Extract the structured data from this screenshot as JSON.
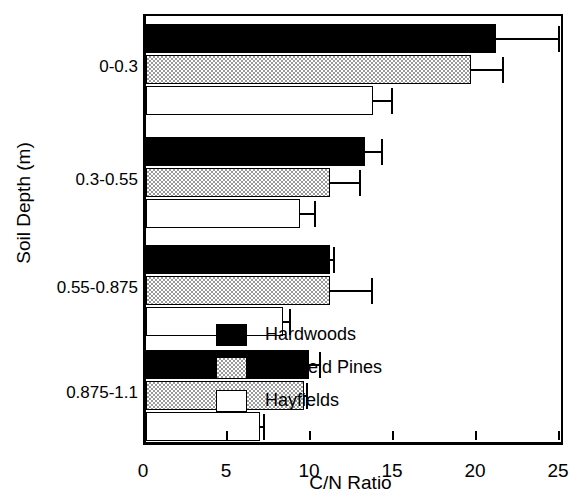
{
  "chart_data": {
    "type": "bar",
    "orientation": "horizontal",
    "title": "",
    "xlabel": "C/N Ratio",
    "ylabel": "Soil Depth (m)",
    "xlim": [
      0,
      25
    ],
    "xticks": [
      0,
      5,
      10,
      15,
      20,
      25
    ],
    "xticklabels": [
      "0",
      "5",
      "10",
      "15",
      "20",
      "25"
    ],
    "grid": false,
    "legend_position": "inside-lower-right",
    "categories": [
      "0-0.3",
      "0.3-0.55",
      "0.55-0.875",
      "0.875-1.1"
    ],
    "series": [
      {
        "name": "Hardwoods",
        "color": "#000000",
        "fill": "solid-black",
        "values": [
          21.1,
          13.2,
          11.1,
          9.8
        ],
        "errors": [
          3.8,
          1.0,
          0.2,
          0.7
        ]
      },
      {
        "name": "Old-field Pines",
        "color": "#c8c8c8",
        "fill": "stipple-gray",
        "values": [
          19.6,
          11.1,
          11.1,
          9.5
        ],
        "errors": [
          1.9,
          1.8,
          2.5,
          0.2
        ]
      },
      {
        "name": "Hayfields",
        "color": "#ffffff",
        "fill": "white",
        "values": [
          13.7,
          9.3,
          8.25,
          6.85
        ],
        "errors": [
          1.1,
          0.9,
          0.45,
          0.25
        ]
      }
    ]
  }
}
